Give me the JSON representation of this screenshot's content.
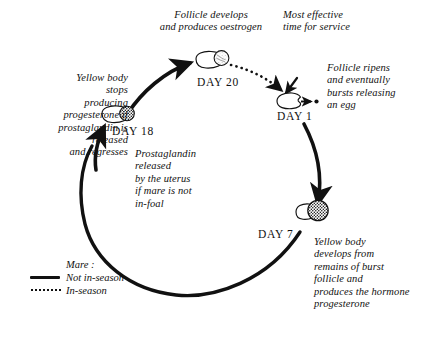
{
  "diagram": {
    "background": "#ffffff",
    "ink": "#111111"
  },
  "annotations": {
    "follicle_develops": "Follicle develops\nand produces oestrogen",
    "most_effective": "Most effective\ntime for service",
    "follicle_ripens": "Follicle ripens\nand eventually\nbursts releasing\nan egg",
    "yellow_body_stops": "Yellow body\nstops\nproducing\nprogesterone if\nprostaglandin is\nreleased\nand regresses",
    "prostaglandin": "Prostaglandin\nreleased\nby the uterus\nif mare is not\nin-foal",
    "yellow_body_develops": "Yellow body\ndevelops from\nremains of burst\nfollicle and\nproduces the hormone\nprogesterone"
  },
  "stages": [
    {
      "id": "day20",
      "label": "DAY 20",
      "structure": "follicle-light-hatched"
    },
    {
      "id": "day1",
      "label": "DAY 1",
      "structure": "follicle-bursting-egg"
    },
    {
      "id": "day7",
      "label": "DAY 7",
      "structure": "corpus-luteum-large-dark"
    },
    {
      "id": "day18",
      "label": "DAY 18",
      "structure": "corpus-luteum-small-dark"
    }
  ],
  "legend": {
    "heading": "Mare :",
    "items": [
      {
        "line_style": "solid",
        "label": "Not in-season"
      },
      {
        "line_style": "dotted",
        "label": "In-season"
      }
    ]
  }
}
